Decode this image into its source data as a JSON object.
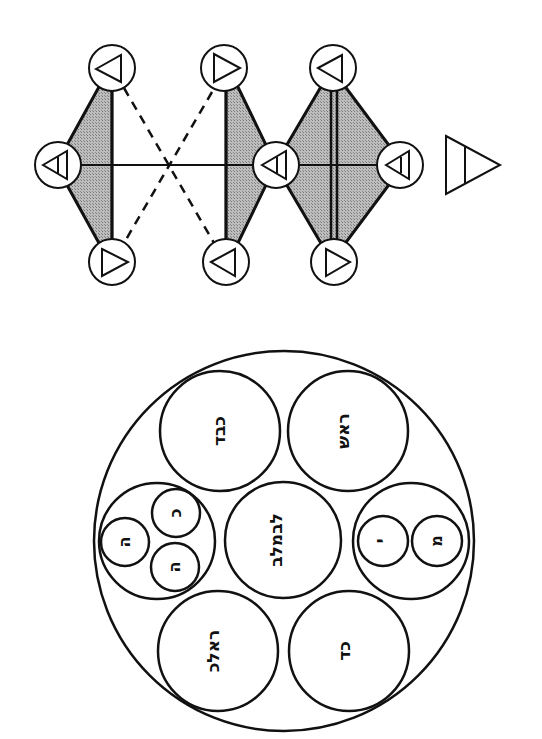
{
  "graph": {
    "nodes": [
      {
        "id": "n1",
        "cx": 112,
        "cy": 68,
        "r": 23,
        "glyph": "triangle-left"
      },
      {
        "id": "n2",
        "cx": 58,
        "cy": 165,
        "r": 23,
        "glyph": "triangle-left-bar"
      },
      {
        "id": "n3",
        "cx": 112,
        "cy": 262,
        "r": 23,
        "glyph": "triangle-right"
      },
      {
        "id": "n4",
        "cx": 224,
        "cy": 68,
        "r": 23,
        "glyph": "triangle-right"
      },
      {
        "id": "n5",
        "cx": 276,
        "cy": 165,
        "r": 23,
        "glyph": "triangle-left-bar"
      },
      {
        "id": "n6",
        "cx": 226,
        "cy": 262,
        "r": 23,
        "glyph": "triangle-left"
      },
      {
        "id": "n7",
        "cx": 333,
        "cy": 68,
        "r": 23,
        "glyph": "triangle-left"
      },
      {
        "id": "n8",
        "cx": 400,
        "cy": 165,
        "r": 23,
        "glyph": "triangle-left-bar"
      },
      {
        "id": "n9",
        "cx": 334,
        "cy": 262,
        "r": 23,
        "glyph": "triangle-right"
      }
    ],
    "standalone_symbol": {
      "glyph": "triangle-right-bar",
      "x": 446,
      "y": 136
    },
    "edges": {
      "solid": [
        "n2-n5",
        "n1-n3",
        "n4-n6",
        "n5-n8"
      ],
      "double": [
        "n7-n9"
      ],
      "dashed": [
        "n1-n6",
        "n3-n4"
      ]
    },
    "shaded_regions": [
      "n1-n2-n3",
      "n4-n5-n6",
      "n7-n5-n9-n8"
    ]
  },
  "circle_diagram": {
    "outer": {
      "cx": 284,
      "cy": 541,
      "r": 190
    },
    "circles": [
      {
        "id": "top-left",
        "cx": 220,
        "cy": 431,
        "r": 60,
        "label": "כבד"
      },
      {
        "id": "top-right",
        "cx": 348,
        "cy": 431,
        "r": 60,
        "label": "ראש"
      },
      {
        "id": "center",
        "cx": 283,
        "cy": 540,
        "r": 58,
        "label": "לבמלב"
      },
      {
        "id": "bottom-left",
        "cx": 218,
        "cy": 651,
        "r": 60,
        "label": "ראלכ"
      },
      {
        "id": "bottom-right",
        "cx": 349,
        "cy": 651,
        "r": 60,
        "label": "כד"
      },
      {
        "id": "left-group",
        "cx": 157,
        "cy": 541,
        "r": 58,
        "label": ""
      },
      {
        "id": "right-group",
        "cx": 411,
        "cy": 541,
        "r": 58,
        "label": ""
      }
    ],
    "sub_circles": [
      {
        "parent": "left-group",
        "cx": 125,
        "cy": 542,
        "r": 24,
        "label": "ה"
      },
      {
        "parent": "left-group",
        "cx": 176,
        "cy": 513,
        "r": 24,
        "label": "כ"
      },
      {
        "parent": "left-group",
        "cx": 175,
        "cy": 567,
        "r": 24,
        "label": "ה"
      },
      {
        "parent": "right-group",
        "cx": 383,
        "cy": 541,
        "r": 25,
        "label": "י"
      },
      {
        "parent": "right-group",
        "cx": 437,
        "cy": 541,
        "r": 25,
        "label": "מ"
      }
    ]
  },
  "colors": {
    "ink": "#111111",
    "shade": "#a8a8a8",
    "background": "#ffffff"
  }
}
